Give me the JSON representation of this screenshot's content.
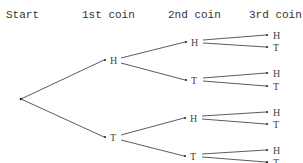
{
  "headers": {
    "start": "Start",
    "level1": "1st coin",
    "level2": "2nd coin",
    "level3": "3rd coin"
  },
  "tree": {
    "level1": [
      {
        "label": "H",
        "x": 105,
        "y": 60
      },
      {
        "label": "T",
        "x": 105,
        "y": 137
      }
    ],
    "level2": [
      {
        "label": "H",
        "x": 186,
        "y": 42
      },
      {
        "label": "T",
        "x": 186,
        "y": 80
      },
      {
        "label": "H",
        "x": 185,
        "y": 118
      },
      {
        "label": "T",
        "x": 185,
        "y": 156
      }
    ],
    "level3": [
      {
        "label": "H",
        "x": 267,
        "y": 35
      },
      {
        "label": "T",
        "x": 267,
        "y": 47
      },
      {
        "label": "H",
        "x": 267,
        "y": 73
      },
      {
        "label": "T",
        "x": 267,
        "y": 86
      },
      {
        "label": "H",
        "x": 267,
        "y": 112
      },
      {
        "label": "T",
        "x": 267,
        "y": 124
      },
      {
        "label": "H",
        "x": 267,
        "y": 150
      },
      {
        "label": "T",
        "x": 267,
        "y": 162
      }
    ]
  }
}
